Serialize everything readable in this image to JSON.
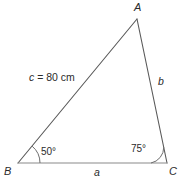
{
  "figure": {
    "kind": "triangle-diagram",
    "background_color": "#ffffff",
    "stroke_color": "#595959",
    "text_color": "#2b2b2b",
    "vertices": [
      {
        "name": "A",
        "label": "A",
        "x": 137,
        "y": 19
      },
      {
        "name": "B",
        "label": "B",
        "x": 18,
        "y": 163
      },
      {
        "name": "C",
        "label": "C",
        "x": 167,
        "y": 163
      }
    ],
    "sides": [
      {
        "name": "a",
        "label": "a",
        "between": "BC",
        "value": ""
      },
      {
        "name": "b",
        "label": "b",
        "between": "AC",
        "value": ""
      },
      {
        "name": "c",
        "label_var": "c",
        "label_value": " = 80 cm",
        "label_full": "c = 80 cm",
        "between": "AB",
        "value": "80",
        "unit": "cm"
      }
    ],
    "angles": [
      {
        "at": "B",
        "label": "50°",
        "measure": 50,
        "arc_radius": 22
      },
      {
        "at": "C",
        "label": "75°",
        "measure": 75,
        "arc_radius": 16
      }
    ]
  }
}
